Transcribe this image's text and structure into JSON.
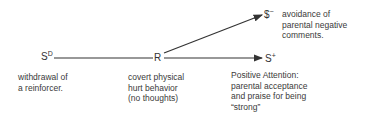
{
  "diagram": {
    "nodes": {
      "sd": {
        "base": "S",
        "sup": "D"
      },
      "r": {
        "base": "R"
      },
      "sminus": {
        "base": "$",
        "sup": "−"
      },
      "splus": {
        "base": "S",
        "sup": "+"
      }
    },
    "labels": {
      "sd": "withdrawal of\na reinforcer.",
      "r": "covert physical\nhurt behavior\n(no thoughts)",
      "sminus": "avoidance of\nparental negative\ncomments.",
      "splus": "Positive Attention:\nparental acceptance\nand praise for being\n“strong”"
    },
    "edges": [
      {
        "from": "S^D",
        "to": "R"
      },
      {
        "from": "R",
        "to": "S^-"
      },
      {
        "from": "R",
        "to": "S^+"
      }
    ]
  }
}
